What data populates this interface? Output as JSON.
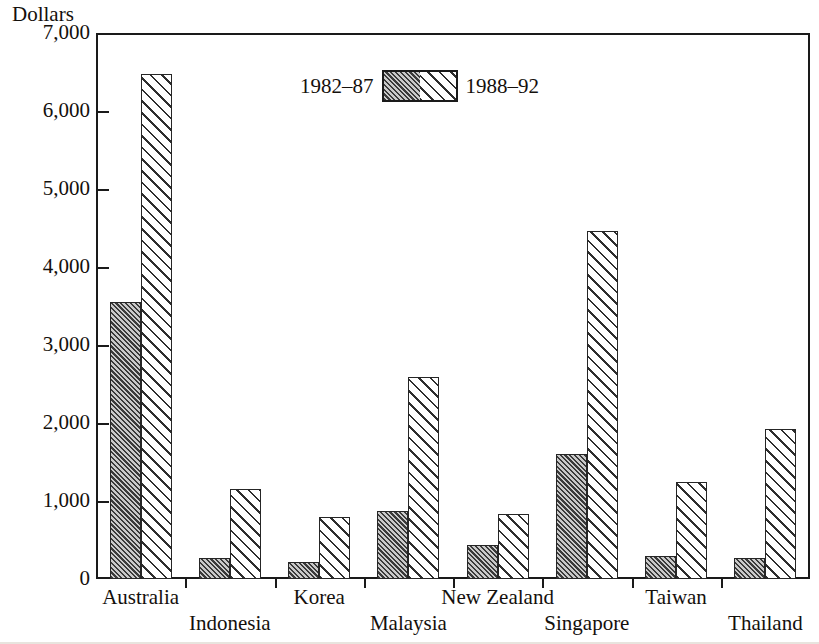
{
  "chart_data": {
    "type": "bar",
    "title": "",
    "xlabel": "",
    "ylabel": "Dollars",
    "ylim": [
      0,
      7000
    ],
    "yticks": [
      0,
      1000,
      2000,
      3000,
      4000,
      5000,
      6000,
      7000
    ],
    "ytick_labels": [
      "0",
      "1,000",
      "2,000",
      "3,000",
      "4,000",
      "5,000",
      "6,000",
      "7,000"
    ],
    "grid": false,
    "legend_position": "top-center",
    "categories": [
      "Australia",
      "Indonesia",
      "Korea",
      "Malaysia",
      "New Zealand",
      "Singapore",
      "Taiwan",
      "Thailand"
    ],
    "series": [
      {
        "name": "1982–87",
        "values": [
          3550,
          270,
          220,
          870,
          440,
          1600,
          300,
          270
        ]
      },
      {
        "name": "1988–92",
        "values": [
          6480,
          1160,
          800,
          2590,
          835,
          4460,
          1250,
          1920
        ]
      }
    ]
  },
  "legend": {
    "left_label": "1982–87",
    "right_label": "1988–92",
    "swatch_name": "legend-swatch"
  },
  "colors": {
    "axis": "#1a1a1a",
    "series_0_fill": "#8e8e8e",
    "series_0_hatch": "#3a3a3a",
    "series_1_fill": "#ffffff",
    "series_1_hatch": "#2e2e2e",
    "background": "#ffffff",
    "text": "#14100c"
  }
}
